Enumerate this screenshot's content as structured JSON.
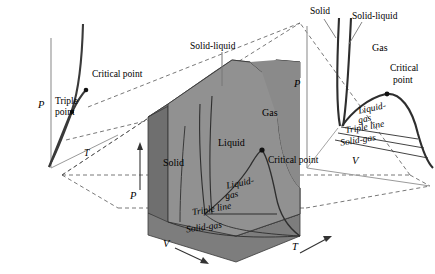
{
  "figure": {
    "type": "thermodynamic-phase-diagram"
  },
  "colors": {
    "surface_front_light": "#9a9a9a",
    "surface_front_mid": "#8c8c8c",
    "surface_top_dark": "#6e6e6e",
    "surface_side_dark": "#7a7a7a",
    "surface_base": "#8f8f8f",
    "curve": "#3a3a3a",
    "dashed": "#555555",
    "axis": "#888888",
    "text": "#000000",
    "background": "#ffffff"
  },
  "left_diagram": {
    "name": "P-T projection",
    "axes": {
      "vertical": "P",
      "horizontal": "T"
    },
    "labels": {
      "critical_point": "Critical point",
      "triple_point_line1": "Triple",
      "triple_point_line2": "point"
    }
  },
  "center_diagram": {
    "name": "P-v-T surface",
    "axes": {
      "vertical": "P",
      "depth": "T",
      "horizontal": "V"
    },
    "regions": [
      {
        "key": "solid",
        "label": "Solid"
      },
      {
        "key": "liquid",
        "label": "Liquid"
      },
      {
        "key": "gas",
        "label": "Gas"
      },
      {
        "key": "liquid_gas_line1",
        "label": "Liquid-"
      },
      {
        "key": "liquid_gas_line2",
        "label": "gas"
      },
      {
        "key": "solid_gas",
        "label": "Solid-gas"
      },
      {
        "key": "triple_line",
        "label": "Triple line"
      }
    ],
    "labels": {
      "solid_liquid": "Solid-liquid",
      "critical_point": "Critical point"
    }
  },
  "right_diagram": {
    "name": "P-V projection",
    "axes": {
      "vertical": "P",
      "horizontal": "V"
    },
    "labels": {
      "solid": "Solid",
      "solid_liquid": "Solid-liquid",
      "gas": "Gas",
      "critical_point_line1": "Critical",
      "critical_point_line2": "point",
      "liquid_gas_line1": "Liquid-",
      "liquid_gas_line2": "gas",
      "triple_line": "Triple line",
      "solid_gas": "Solid-gas"
    }
  }
}
